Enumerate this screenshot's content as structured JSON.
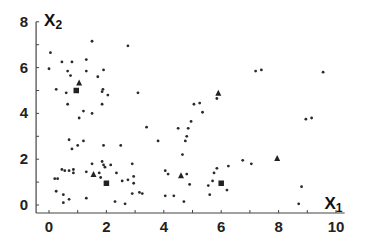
{
  "chart_data": {
    "type": "scatter",
    "title": "",
    "xlabel": {
      "main": "X",
      "sub": "1"
    },
    "ylabel": {
      "main": "X",
      "sub": "2"
    },
    "xlim": [
      -0.45,
      10.3
    ],
    "ylim": [
      -0.35,
      8.0
    ],
    "x_ticks": [
      0,
      2,
      4,
      6,
      8,
      10
    ],
    "y_ticks": [
      0,
      2,
      4,
      6,
      8
    ],
    "x_minor_step": 1,
    "y_minor_step": 1,
    "grid": false,
    "series": [
      {
        "name": "data points",
        "marker": "dot",
        "points": [
          [
            0.05,
            6.65
          ],
          [
            0.0,
            5.95
          ],
          [
            0.45,
            6.25
          ],
          [
            0.8,
            6.25
          ],
          [
            1.3,
            6.35
          ],
          [
            1.5,
            7.15
          ],
          [
            2.75,
            6.95
          ],
          [
            0.65,
            5.85
          ],
          [
            0.75,
            5.65
          ],
          [
            1.3,
            5.85
          ],
          [
            1.7,
            5.6
          ],
          [
            1.9,
            5.9
          ],
          [
            0.25,
            5.05
          ],
          [
            0.6,
            4.9
          ],
          [
            1.85,
            4.95
          ],
          [
            1.88,
            5.05
          ],
          [
            2.05,
            4.8
          ],
          [
            3.1,
            4.9
          ],
          [
            0.65,
            4.4
          ],
          [
            1.85,
            4.4
          ],
          [
            1.2,
            4.1
          ],
          [
            1.5,
            4.0
          ],
          [
            1.05,
            3.8
          ],
          [
            3.4,
            3.4
          ],
          [
            3.8,
            2.8
          ],
          [
            0.7,
            2.85
          ],
          [
            1.0,
            2.6
          ],
          [
            1.2,
            2.8
          ],
          [
            0.8,
            2.45
          ],
          [
            1.9,
            2.6
          ],
          [
            2.5,
            2.6
          ],
          [
            2.15,
            1.75
          ],
          [
            4.05,
            1.5
          ],
          [
            4.15,
            1.35
          ],
          [
            4.5,
            3.35
          ],
          [
            4.85,
            3.35
          ],
          [
            4.95,
            3.65
          ],
          [
            4.8,
            3.0
          ],
          [
            4.75,
            2.8
          ],
          [
            4.65,
            2.2
          ],
          [
            5.35,
            4.05
          ],
          [
            5.85,
            4.65
          ],
          [
            5.05,
            4.4
          ],
          [
            5.25,
            4.45
          ],
          [
            7.2,
            5.85
          ],
          [
            7.4,
            5.9
          ],
          [
            9.55,
            5.8
          ],
          [
            8.95,
            3.75
          ],
          [
            9.15,
            3.8
          ],
          [
            0.2,
            1.15
          ],
          [
            0.3,
            1.15
          ],
          [
            0.45,
            1.55
          ],
          [
            0.55,
            1.5
          ],
          [
            0.7,
            1.5
          ],
          [
            0.85,
            1.55
          ],
          [
            0.85,
            1.4
          ],
          [
            1.3,
            1.45
          ],
          [
            1.5,
            1.8
          ],
          [
            1.85,
            1.9
          ],
          [
            1.9,
            1.75
          ],
          [
            1.95,
            1.65
          ],
          [
            1.8,
            1.2
          ],
          [
            1.75,
            1.4
          ],
          [
            2.35,
            1.4
          ],
          [
            2.55,
            1.05
          ],
          [
            2.75,
            1.1
          ],
          [
            2.95,
            1.25
          ],
          [
            2.9,
            1.8
          ],
          [
            2.95,
            0.95
          ],
          [
            0.25,
            0.6
          ],
          [
            0.5,
            0.45
          ],
          [
            0.5,
            0.1
          ],
          [
            0.7,
            0.25
          ],
          [
            1.3,
            0.3
          ],
          [
            2.3,
            0.15
          ],
          [
            2.65,
            0.05
          ],
          [
            2.9,
            0.5
          ],
          [
            3.15,
            0.55
          ],
          [
            3.25,
            0.5
          ],
          [
            4.05,
            0.4
          ],
          [
            4.35,
            0.4
          ],
          [
            4.7,
            0.15
          ],
          [
            4.8,
            1.35
          ],
          [
            4.9,
            0.9
          ],
          [
            5.55,
            0.85
          ],
          [
            5.7,
            1.05
          ],
          [
            5.6,
            0.45
          ],
          [
            5.75,
            1.4
          ],
          [
            5.85,
            1.6
          ],
          [
            6.25,
            1.7
          ],
          [
            6.2,
            0.65
          ],
          [
            6.75,
            1.95
          ],
          [
            7.05,
            1.8
          ],
          [
            8.7,
            0.05
          ],
          [
            8.8,
            0.8
          ]
        ]
      },
      {
        "name": "triangles",
        "marker": "triangle",
        "points": [
          [
            1.05,
            5.35
          ],
          [
            1.55,
            1.35
          ],
          [
            4.6,
            1.3
          ],
          [
            5.9,
            4.9
          ],
          [
            7.95,
            2.05
          ]
        ]
      },
      {
        "name": "squares",
        "marker": "square",
        "points": [
          [
            0.95,
            5.0
          ],
          [
            2.0,
            0.95
          ],
          [
            6.0,
            0.95
          ]
        ]
      }
    ]
  }
}
